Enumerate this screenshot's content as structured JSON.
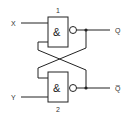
{
  "diagram": {
    "type": "SR latch (cross-coupled NAND gates)",
    "gates": [
      {
        "id": "1",
        "label": "1",
        "symbol": "&",
        "input_label": "X",
        "output_label": "Q"
      },
      {
        "id": "2",
        "label": "2",
        "symbol": "&",
        "input_label": "Y",
        "output_label": "Q̅"
      }
    ],
    "colors": {
      "line": "#222222",
      "background": "#ffffff"
    }
  }
}
